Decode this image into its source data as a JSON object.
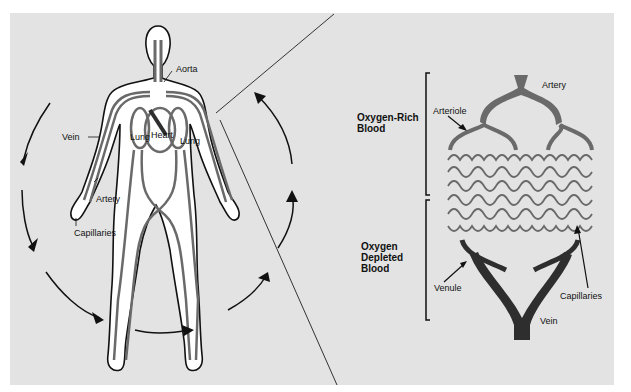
{
  "figure": {
    "colors": {
      "background": "#e3e3e3",
      "body_fill": "#ffffff",
      "outline": "#111111",
      "vessel": "#6a6a6a",
      "dark_vessel": "#2e2e2e"
    }
  },
  "body_panel": {
    "labels": {
      "aorta": "Aorta",
      "vein": "Vein",
      "lung_left": "Lung",
      "heart": "Heart",
      "lung_right": "Lung",
      "artery": "Artery",
      "capillaries": "Capillaries"
    },
    "flow_arrows": [
      "arrow-1",
      "arrow-2",
      "arrow-3",
      "arrow-4",
      "arrow-5",
      "arrow-6"
    ]
  },
  "capillary_panel": {
    "labels": {
      "artery": "Artery",
      "arteriole": "Arteriole",
      "capillaries": "Capillaries",
      "venule": "Venule",
      "vein": "Vein"
    },
    "brackets": {
      "oxygen_rich": "Oxygen-Rich\nBlood",
      "oxygen_depleted": "Oxygen\nDepleted\nBlood"
    }
  }
}
